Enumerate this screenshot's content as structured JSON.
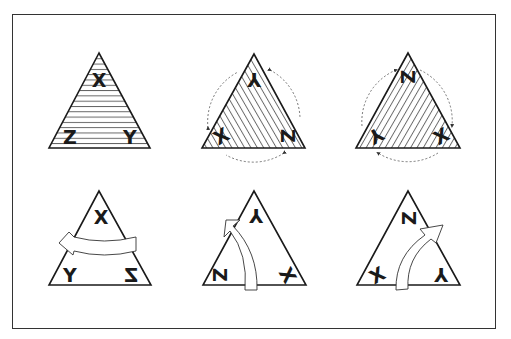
{
  "figure": {
    "frame_color": "#333333",
    "line_color": "#1a1a1a",
    "dash_color": "#555555"
  },
  "panels": [
    {
      "id": "identity",
      "row": 1,
      "hatch": "horizontal",
      "labels": {
        "apex": "X",
        "left": "Z",
        "right": "Y"
      },
      "glyph_transform": {
        "apex": "",
        "left": "",
        "right": ""
      },
      "operation": "none"
    },
    {
      "id": "rotate-clockwise",
      "row": 1,
      "hatch": "diagonal-down",
      "labels": {
        "apex": "Y",
        "left": "X",
        "right": "Z"
      },
      "glyph_transform": {
        "apex": "rotate(-120)",
        "left": "rotate(120)",
        "right": "rotate(120)"
      },
      "operation": "rotation",
      "direction": "clockwise"
    },
    {
      "id": "rotate-counterclockwise",
      "row": 1,
      "hatch": "diagonal-up",
      "labels": {
        "apex": "Z",
        "left": "Y",
        "right": "X"
      },
      "glyph_transform": {
        "apex": "rotate(120)",
        "left": "rotate(-120)",
        "right": "rotate(-120)"
      },
      "operation": "rotation",
      "direction": "counterclockwise"
    },
    {
      "id": "reflect-vertical",
      "row": 2,
      "hatch": "none",
      "labels": {
        "apex": "X",
        "left": "Y",
        "right": "Z"
      },
      "glyph_transform": {
        "apex": "",
        "left": "",
        "right": "scale(-1,1)"
      },
      "operation": "reflection",
      "axis": "vertical"
    },
    {
      "id": "reflect-left",
      "row": 2,
      "hatch": "none",
      "labels": {
        "apex": "Y",
        "left": "Z",
        "right": "X"
      },
      "glyph_transform": {
        "apex": "rotate(180)",
        "left": "rotate(90)",
        "right": "rotate(60)"
      },
      "operation": "reflection",
      "axis": "left"
    },
    {
      "id": "reflect-right",
      "row": 2,
      "hatch": "none",
      "labels": {
        "apex": "Z",
        "left": "X",
        "right": "Y"
      },
      "glyph_transform": {
        "apex": "rotate(-90)",
        "left": "rotate(-30)",
        "right": "rotate(180)"
      },
      "operation": "reflection",
      "axis": "right"
    }
  ]
}
